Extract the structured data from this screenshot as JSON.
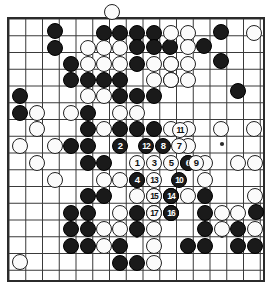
{
  "figure": {
    "kind": "go-board-diagram",
    "title": "",
    "caption": "",
    "board_width_px": 273,
    "board_height_px": 300
  },
  "board": {
    "origin_x": 9,
    "origin_y": 19,
    "spacing": 16.75,
    "cols": 16,
    "rows": 16,
    "stone_radius": 8.4,
    "line_color": "#3a3a3a",
    "border_color": "#2b2b2b",
    "background_color": "#ffffff",
    "black_color": "#1a1a1a",
    "white_color": "#fbfbfb",
    "border_left": 8,
    "border_top": 18,
    "border_right": 264,
    "border_bottom": 281,
    "star_points": [
      {
        "x": 222,
        "y": 144
      },
      {
        "x": 137,
        "y": 236
      },
      {
        "x": 222,
        "y": 236
      }
    ]
  },
  "stones": {
    "black": [
      {
        "x": 104,
        "y": 33
      },
      {
        "x": 120,
        "y": 33
      },
      {
        "x": 137,
        "y": 33
      },
      {
        "x": 154,
        "y": 33
      },
      {
        "x": 55,
        "y": 31
      },
      {
        "x": 221,
        "y": 32
      },
      {
        "x": 55,
        "y": 48
      },
      {
        "x": 137,
        "y": 47
      },
      {
        "x": 154,
        "y": 47
      },
      {
        "x": 170,
        "y": 47
      },
      {
        "x": 204,
        "y": 46
      },
      {
        "x": 71,
        "y": 64
      },
      {
        "x": 137,
        "y": 64
      },
      {
        "x": 171,
        "y": 64
      },
      {
        "x": 221,
        "y": 61
      },
      {
        "x": 71,
        "y": 80
      },
      {
        "x": 88,
        "y": 80
      },
      {
        "x": 104,
        "y": 80
      },
      {
        "x": 120,
        "y": 80
      },
      {
        "x": 171,
        "y": 80
      },
      {
        "x": 20,
        "y": 96
      },
      {
        "x": 120,
        "y": 96
      },
      {
        "x": 137,
        "y": 96
      },
      {
        "x": 154,
        "y": 96
      },
      {
        "x": 238,
        "y": 91
      },
      {
        "x": 20,
        "y": 113
      },
      {
        "x": 88,
        "y": 113
      },
      {
        "x": 88,
        "y": 129
      },
      {
        "x": 71,
        "y": 146
      },
      {
        "x": 88,
        "y": 146
      },
      {
        "x": 120,
        "y": 129
      },
      {
        "x": 137,
        "y": 129
      },
      {
        "x": 154,
        "y": 129
      },
      {
        "x": 88,
        "y": 163
      },
      {
        "x": 104,
        "y": 163
      },
      {
        "x": 171,
        "y": 196
      },
      {
        "x": 88,
        "y": 196
      },
      {
        "x": 104,
        "y": 196
      },
      {
        "x": 171,
        "y": 213
      },
      {
        "x": 88,
        "y": 213
      },
      {
        "x": 71,
        "y": 213
      },
      {
        "x": 137,
        "y": 213
      },
      {
        "x": 205,
        "y": 196
      },
      {
        "x": 205,
        "y": 213
      },
      {
        "x": 71,
        "y": 229
      },
      {
        "x": 88,
        "y": 229
      },
      {
        "x": 137,
        "y": 229
      },
      {
        "x": 205,
        "y": 229
      },
      {
        "x": 238,
        "y": 229
      },
      {
        "x": 71,
        "y": 246
      },
      {
        "x": 88,
        "y": 246
      },
      {
        "x": 120,
        "y": 246
      },
      {
        "x": 188,
        "y": 246
      },
      {
        "x": 205,
        "y": 246
      },
      {
        "x": 238,
        "y": 246
      },
      {
        "x": 255,
        "y": 246
      },
      {
        "x": 120,
        "y": 263
      },
      {
        "x": 137,
        "y": 263
      },
      {
        "x": 256,
        "y": 212
      }
    ],
    "white": [
      {
        "x": 112,
        "y": 12
      },
      {
        "x": 171,
        "y": 33
      },
      {
        "x": 188,
        "y": 33
      },
      {
        "x": 188,
        "y": 47
      },
      {
        "x": 254,
        "y": 33
      },
      {
        "x": 88,
        "y": 48
      },
      {
        "x": 104,
        "y": 48
      },
      {
        "x": 120,
        "y": 48
      },
      {
        "x": 188,
        "y": 64
      },
      {
        "x": 88,
        "y": 64
      },
      {
        "x": 104,
        "y": 64
      },
      {
        "x": 120,
        "y": 64
      },
      {
        "x": 154,
        "y": 64
      },
      {
        "x": 171,
        "y": 64
      },
      {
        "x": 154,
        "y": 80
      },
      {
        "x": 171,
        "y": 80
      },
      {
        "x": 188,
        "y": 80
      },
      {
        "x": 37,
        "y": 113
      },
      {
        "x": 104,
        "y": 96
      },
      {
        "x": 88,
        "y": 96
      },
      {
        "x": 71,
        "y": 113
      },
      {
        "x": 37,
        "y": 129
      },
      {
        "x": 104,
        "y": 129
      },
      {
        "x": 120,
        "y": 113
      },
      {
        "x": 137,
        "y": 113
      },
      {
        "x": 171,
        "y": 129
      },
      {
        "x": 188,
        "y": 129
      },
      {
        "x": 221,
        "y": 129
      },
      {
        "x": 254,
        "y": 129
      },
      {
        "x": 55,
        "y": 146
      },
      {
        "x": 188,
        "y": 146
      },
      {
        "x": 205,
        "y": 163
      },
      {
        "x": 238,
        "y": 163
      },
      {
        "x": 255,
        "y": 163
      },
      {
        "x": 188,
        "y": 163
      },
      {
        "x": 205,
        "y": 180
      },
      {
        "x": 37,
        "y": 163
      },
      {
        "x": 104,
        "y": 180
      },
      {
        "x": 120,
        "y": 180
      },
      {
        "x": 137,
        "y": 180
      },
      {
        "x": 188,
        "y": 196
      },
      {
        "x": 154,
        "y": 196
      },
      {
        "x": 137,
        "y": 196
      },
      {
        "x": 120,
        "y": 213
      },
      {
        "x": 154,
        "y": 213
      },
      {
        "x": 222,
        "y": 213
      },
      {
        "x": 238,
        "y": 213
      },
      {
        "x": 255,
        "y": 196
      },
      {
        "x": 104,
        "y": 229
      },
      {
        "x": 120,
        "y": 229
      },
      {
        "x": 154,
        "y": 229
      },
      {
        "x": 222,
        "y": 229
      },
      {
        "x": 255,
        "y": 229
      },
      {
        "x": 104,
        "y": 246
      },
      {
        "x": 154,
        "y": 246
      },
      {
        "x": 154,
        "y": 263
      },
      {
        "x": 20,
        "y": 262
      },
      {
        "x": 20,
        "y": 146
      },
      {
        "x": 55,
        "y": 180
      }
    ],
    "numbered": [
      {
        "n": 1,
        "color": "white",
        "x": 137,
        "y": 163
      },
      {
        "n": 2,
        "color": "black",
        "x": 120,
        "y": 146
      },
      {
        "n": 3,
        "color": "white",
        "x": 154,
        "y": 163
      },
      {
        "n": 4,
        "color": "black",
        "x": 137,
        "y": 180
      },
      {
        "n": 5,
        "color": "white",
        "x": 171,
        "y": 163
      },
      {
        "n": 6,
        "color": "black",
        "x": 188,
        "y": 163
      },
      {
        "n": 7,
        "color": "white",
        "x": 179,
        "y": 146
      },
      {
        "n": 8,
        "color": "black",
        "x": 163,
        "y": 146
      },
      {
        "n": 9,
        "color": "white",
        "x": 196,
        "y": 163
      },
      {
        "n": 10,
        "color": "black",
        "x": 179,
        "y": 180
      },
      {
        "n": 11,
        "color": "white",
        "x": 180,
        "y": 130
      },
      {
        "n": 12,
        "color": "black",
        "x": 146,
        "y": 146
      },
      {
        "n": 13,
        "color": "white",
        "x": 154,
        "y": 180
      },
      {
        "n": 14,
        "color": "black",
        "x": 171,
        "y": 196
      },
      {
        "n": 15,
        "color": "white",
        "x": 154,
        "y": 196
      },
      {
        "n": 16,
        "color": "black",
        "x": 171,
        "y": 213
      },
      {
        "n": 17,
        "color": "white",
        "x": 154,
        "y": 213
      }
    ]
  }
}
